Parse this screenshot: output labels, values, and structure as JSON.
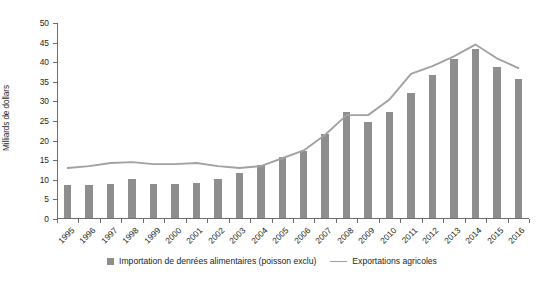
{
  "chart_data": {
    "type": "bar",
    "title": "",
    "xlabel": "",
    "ylabel": "Milliards de dollars",
    "ylim": [
      0,
      50
    ],
    "yticks": [
      0,
      5,
      10,
      15,
      20,
      25,
      30,
      35,
      40,
      45,
      50
    ],
    "grid": false,
    "legend_position": "bottom",
    "categories": [
      "1995",
      "1996",
      "1997",
      "1998",
      "1999",
      "2000",
      "2001",
      "2002",
      "2003",
      "2004",
      "2005",
      "2006",
      "2007",
      "2008",
      "2009",
      "2010",
      "2011",
      "2012",
      "2013",
      "2014",
      "2015",
      "2016"
    ],
    "series": [
      {
        "name": "Importation de denrées alimentaires (poisson exclu)",
        "type": "bar",
        "color": "#8e8e8e",
        "values": [
          8.5,
          8.5,
          8.7,
          10.0,
          8.7,
          8.8,
          9.0,
          10.0,
          11.5,
          13.5,
          15.5,
          17.0,
          21.5,
          27.0,
          24.5,
          27.0,
          32.0,
          36.5,
          40.5,
          43.0,
          38.5,
          35.5
        ]
      },
      {
        "name": "Exportations agricoles",
        "type": "line",
        "color": "#a2a2a2",
        "values": [
          13.0,
          13.5,
          14.3,
          14.5,
          14.0,
          14.0,
          14.3,
          13.5,
          13.0,
          13.5,
          15.5,
          17.5,
          21.5,
          26.5,
          26.5,
          30.5,
          37.0,
          39.0,
          41.5,
          44.5,
          41.0,
          38.5
        ]
      }
    ]
  },
  "legend": {
    "items": [
      {
        "label": "Importation de denrées alimentaires (poisson exclu)",
        "marker": "bar-swatch"
      },
      {
        "label": "Exportations agricoles",
        "marker": "line-swatch"
      }
    ]
  }
}
